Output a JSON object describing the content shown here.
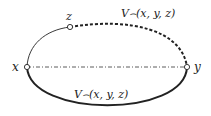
{
  "nodes": {
    "x": {
      "label": "x"
    },
    "y": {
      "label": "y"
    },
    "z": {
      "label": "z"
    }
  },
  "edges": {
    "upper_label": "V⌢(x, y, z)",
    "lower_label": "V⌢(x, y, z)"
  },
  "colors": {
    "stroke": "#222222",
    "background": "#ffffff"
  }
}
